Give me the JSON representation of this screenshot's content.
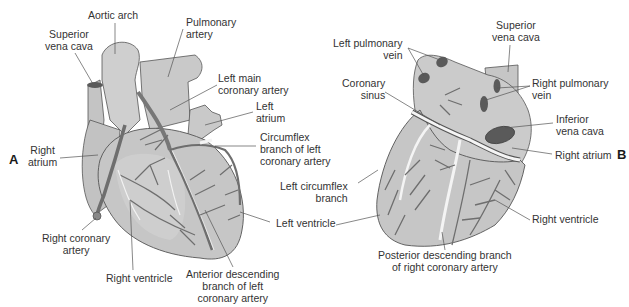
{
  "figure": {
    "panels": [
      {
        "letter": "A",
        "view": "anterior",
        "labels": {
          "aortic_arch": "Aortic arch",
          "superior_vena_cava_1": "Superior",
          "superior_vena_cava_2": "vena cava",
          "pulmonary_artery_1": "Pulmonary",
          "pulmonary_artery_2": "artery",
          "left_main_coronary_1": "Left main",
          "left_main_coronary_2": "coronary artery",
          "left_atrium_1": "Left",
          "left_atrium_2": "atrium",
          "circumflex_1": "Circumflex",
          "circumflex_2": "branch of left",
          "circumflex_3": "coronary artery",
          "right_atrium_1": "Right",
          "right_atrium_2": "atrium",
          "left_ventricle": "Left ventricle",
          "right_coronary_1": "Right coronary",
          "right_coronary_2": "artery",
          "right_ventricle": "Right ventricle",
          "anterior_descending_1": "Anterior descending",
          "anterior_descending_2": "branch of left",
          "anterior_descending_3": "coronary artery"
        }
      },
      {
        "letter": "B",
        "view": "posterior",
        "labels": {
          "left_pulmonary_vein_1": "Left pulmonary",
          "left_pulmonary_vein_2": "vein",
          "superior_vena_cava_1": "Superior",
          "superior_vena_cava_2": "vena cava",
          "coronary_sinus_1": "Coronary",
          "coronary_sinus_2": "sinus",
          "right_pulmonary_vein_1": "Right pulmonary",
          "right_pulmonary_vein_2": "vein",
          "inferior_vena_cava_1": "Inferior",
          "inferior_vena_cava_2": "vena cava",
          "right_atrium": "Right atrium",
          "left_circumflex_1": "Left circumflex",
          "left_circumflex_2": "branch",
          "right_ventricle": "Right ventricle",
          "posterior_descending_1": "Posterior descending branch",
          "posterior_descending_2": "of right coronary artery"
        }
      }
    ],
    "colors": {
      "tissue": "#c9c9c9",
      "tissue_light": "#d8d8d8",
      "vessel_dark": "#6e6e6e",
      "vessel_light": "#f4f4f4",
      "outline": "#555555",
      "leader": "#555555",
      "vessel_opening": "#5a5a5a"
    }
  }
}
